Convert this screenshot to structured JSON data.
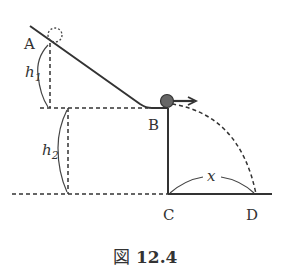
{
  "figure": {
    "caption_prefix": "図",
    "caption_number": "12.4",
    "labels": {
      "A": "A",
      "B": "B",
      "C": "C",
      "D": "D",
      "h1_main": "h",
      "h1_sub": "1",
      "h2_main": "h",
      "h2_sub": "2",
      "x": "x"
    },
    "colors": {
      "line": "#333333",
      "ball": "#666666",
      "background": "#ffffff"
    }
  }
}
